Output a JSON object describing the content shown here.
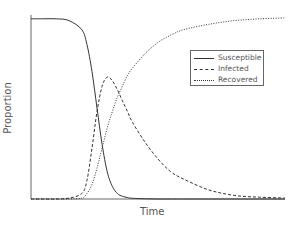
{
  "chart_data": {
    "type": "line",
    "title": "",
    "xlabel": "Time",
    "ylabel": "Proportion",
    "xlim": [
      0,
      100
    ],
    "ylim": [
      0,
      1
    ],
    "grid": false,
    "legend_position": "upper right (inset)",
    "x": [
      0,
      5,
      10,
      15,
      20,
      22,
      24,
      26,
      28,
      30,
      32,
      34,
      36,
      38,
      40,
      45,
      50,
      55,
      60,
      70,
      80,
      90,
      100
    ],
    "series": [
      {
        "name": "Susceptible",
        "style": "solid",
        "values": [
          0.99,
          0.99,
          0.99,
          0.98,
          0.93,
          0.85,
          0.7,
          0.5,
          0.3,
          0.15,
          0.07,
          0.03,
          0.015,
          0.008,
          0.004,
          0.001,
          0.0,
          0.0,
          0.0,
          0.0,
          0.0,
          0.0,
          0.0
        ]
      },
      {
        "name": "Infected",
        "style": "dashed",
        "values": [
          0.0,
          0.0,
          0.0,
          0.005,
          0.03,
          0.1,
          0.28,
          0.48,
          0.62,
          0.67,
          0.65,
          0.6,
          0.54,
          0.48,
          0.42,
          0.31,
          0.22,
          0.15,
          0.11,
          0.05,
          0.02,
          0.01,
          0.005
        ]
      },
      {
        "name": "Recovered",
        "style": "dotted",
        "values": [
          0.0,
          0.0,
          0.0,
          0.0,
          0.005,
          0.03,
          0.08,
          0.17,
          0.28,
          0.39,
          0.48,
          0.56,
          0.62,
          0.68,
          0.72,
          0.8,
          0.86,
          0.9,
          0.93,
          0.96,
          0.98,
          0.99,
          0.995
        ]
      }
    ]
  },
  "legend": {
    "items": [
      {
        "label": "Susceptible",
        "style": "solid"
      },
      {
        "label": "Infected",
        "style": "dashed"
      },
      {
        "label": "Recovered",
        "style": "dotted"
      }
    ]
  },
  "axes": {
    "xlabel": "Time",
    "ylabel": "Proportion"
  },
  "colors": {
    "line": "#333333",
    "axis": "#555555",
    "text": "#555555"
  }
}
